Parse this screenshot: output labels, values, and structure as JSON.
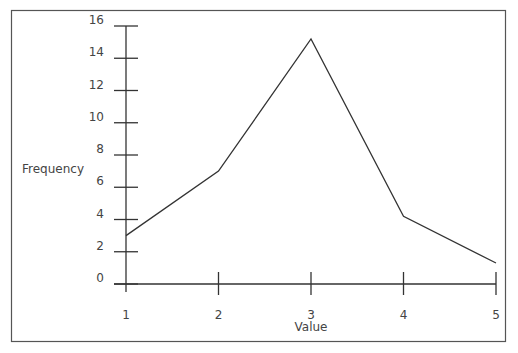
{
  "chart_data": {
    "type": "line",
    "title": "",
    "xlabel": "Value",
    "ylabel": "Frequency",
    "categories": [
      1,
      2,
      3,
      4,
      5
    ],
    "x": [
      1,
      2,
      3,
      4,
      5
    ],
    "series": [
      {
        "name": "Frequency",
        "values": [
          3,
          7,
          15.2,
          4.2,
          1.3
        ]
      }
    ],
    "xlim": [
      1,
      5
    ],
    "ylim": [
      0,
      16
    ],
    "x_ticks": [
      "1",
      "2",
      "3",
      "4",
      "5"
    ],
    "y_ticks": [
      "0",
      "2",
      "4",
      "6",
      "8",
      "10",
      "12",
      "14",
      "16"
    ],
    "grid": false,
    "legend": null
  },
  "colors": {
    "line": "#333333",
    "axis": "#333333",
    "frame": "#555555",
    "text": "#444444"
  }
}
